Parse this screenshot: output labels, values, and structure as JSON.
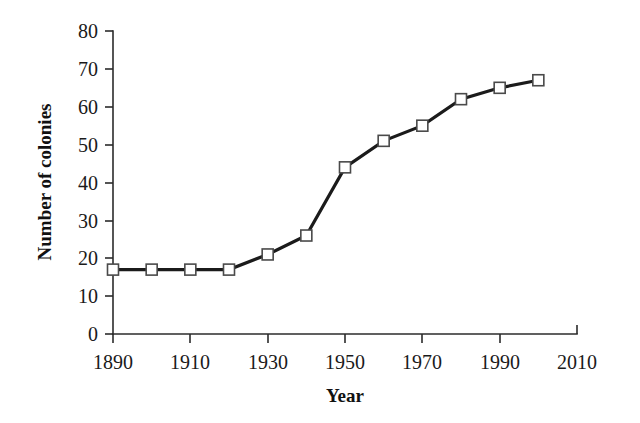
{
  "chart_data": {
    "type": "line",
    "title": "",
    "subtitle": "",
    "xlabel": "Year",
    "ylabel": "Number of colonies",
    "x": [
      1890,
      1900,
      1910,
      1920,
      1930,
      1940,
      1950,
      1960,
      1970,
      1980,
      1990,
      2000
    ],
    "series": [
      {
        "name": "Number of colonies",
        "values": [
          17,
          17,
          17,
          17,
          21,
          26,
          44,
          51,
          55,
          62,
          65,
          67
        ]
      }
    ],
    "xlim": [
      1890,
      2010
    ],
    "ylim": [
      0,
      80
    ],
    "xticks": [
      1890,
      1910,
      1930,
      1950,
      1970,
      1990,
      2010
    ],
    "xtick_labels": [
      "1890",
      "1910",
      "1930",
      "1950",
      "1970",
      "1990",
      "2010"
    ],
    "yticks": [
      0,
      10,
      20,
      30,
      40,
      50,
      60,
      70,
      80
    ],
    "ytick_labels": [
      "0",
      "10",
      "20",
      "30",
      "40",
      "50",
      "60",
      "70",
      "80"
    ],
    "grid": false,
    "legend": "none",
    "marker": "open-square",
    "line_color": "#1b1b1b",
    "marker_fill": "#ffffff",
    "marker_edge": "#4a4a4a",
    "background": "#ffffff"
  }
}
